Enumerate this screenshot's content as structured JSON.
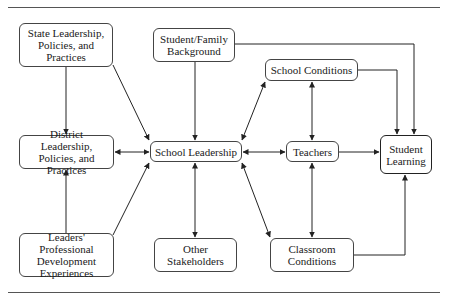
{
  "diagram": {
    "nodes": [
      {
        "id": "state",
        "label": "State Leadership, Policies, and Practices"
      },
      {
        "id": "family",
        "label": "Student/Family Background"
      },
      {
        "id": "school_conditions",
        "label": "School Conditions"
      },
      {
        "id": "district",
        "label": "District Leadership, Policies, and Practices"
      },
      {
        "id": "school_leadership",
        "label": "School Leadership"
      },
      {
        "id": "teachers",
        "label": "Teachers"
      },
      {
        "id": "student_learning",
        "label": "Student Learning"
      },
      {
        "id": "leaders_pd",
        "label": "Leaders' Professional Development Experiences"
      },
      {
        "id": "other_stakeholders",
        "label": "Other Stakeholders"
      },
      {
        "id": "classroom_conditions",
        "label": "Classroom Conditions"
      }
    ],
    "edges": [
      {
        "from": "state",
        "to": "district",
        "direction": "one-way"
      },
      {
        "from": "state",
        "to": "school_leadership",
        "direction": "one-way"
      },
      {
        "from": "family",
        "to": "school_leadership",
        "direction": "one-way"
      },
      {
        "from": "family",
        "to": "student_learning",
        "direction": "one-way"
      },
      {
        "from": "school_conditions",
        "to": "student_learning",
        "direction": "one-way"
      },
      {
        "from": "school_leadership",
        "to": "school_conditions",
        "direction": "two-way"
      },
      {
        "from": "teachers",
        "to": "school_conditions",
        "direction": "two-way"
      },
      {
        "from": "district",
        "to": "school_leadership",
        "direction": "two-way"
      },
      {
        "from": "school_leadership",
        "to": "teachers",
        "direction": "two-way"
      },
      {
        "from": "teachers",
        "to": "student_learning",
        "direction": "one-way"
      },
      {
        "from": "leaders_pd",
        "to": "district",
        "direction": "one-way"
      },
      {
        "from": "leaders_pd",
        "to": "school_leadership",
        "direction": "one-way"
      },
      {
        "from": "school_leadership",
        "to": "other_stakeholders",
        "direction": "two-way"
      },
      {
        "from": "school_leadership",
        "to": "classroom_conditions",
        "direction": "two-way"
      },
      {
        "from": "teachers",
        "to": "classroom_conditions",
        "direction": "two-way"
      },
      {
        "from": "classroom_conditions",
        "to": "student_learning",
        "direction": "one-way"
      }
    ]
  },
  "colors": {
    "line": "#222222",
    "border": "#444444",
    "rule": "#555555",
    "background": "#ffffff"
  }
}
